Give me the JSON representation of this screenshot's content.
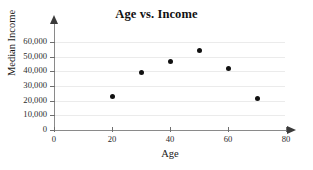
{
  "chart_data": {
    "type": "scatter",
    "title": "Age vs. Income",
    "xlabel": "Age",
    "ylabel": "Median Income",
    "xlim": [
      0,
      80
    ],
    "ylim": [
      0,
      65000
    ],
    "grid": true,
    "legend": null,
    "x_ticks": [
      0,
      20,
      40,
      60,
      80
    ],
    "x_tick_labels": [
      "0",
      "20",
      "40",
      "60",
      "80"
    ],
    "y_ticks": [
      0,
      10000,
      20000,
      30000,
      40000,
      50000,
      60000
    ],
    "y_tick_labels": [
      "0",
      "10,000",
      "20,000",
      "30,000",
      "40,000",
      "50,000",
      "60,000"
    ],
    "points": [
      {
        "x": 20,
        "y": 23000
      },
      {
        "x": 30,
        "y": 39000
      },
      {
        "x": 40,
        "y": 46500
      },
      {
        "x": 50,
        "y": 54000
      },
      {
        "x": 60,
        "y": 42000
      },
      {
        "x": 70,
        "y": 21500
      }
    ],
    "series": [
      {
        "name": "Median Income by Age",
        "x": [
          20,
          30,
          40,
          50,
          60,
          70
        ],
        "values": [
          23000,
          39000,
          46500,
          54000,
          42000,
          21500
        ]
      }
    ]
  },
  "colors": {
    "background": "#ffffff",
    "gridline": "#ebebeb",
    "axis": "#8a8a8a",
    "marker": "#111111",
    "text": "#1a1a1a"
  }
}
